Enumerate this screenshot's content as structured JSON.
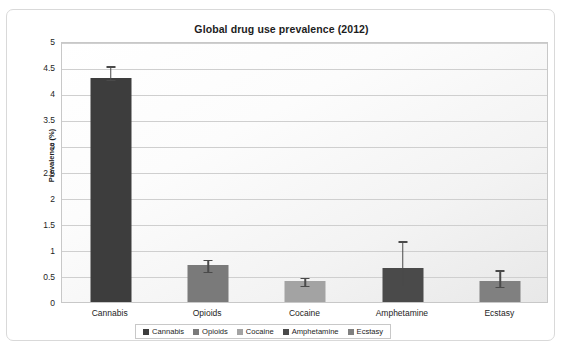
{
  "chart_data": {
    "type": "bar",
    "title": "Global drug use prevalence (2012)",
    "xlabel": "",
    "ylabel": "Prevalence (%)",
    "ylim": [
      0,
      5
    ],
    "ytick_step": 0.5,
    "ytick_labels": [
      "5",
      "4.5",
      "4",
      "3.5",
      "3",
      "2.5",
      "2",
      "1.5",
      "1",
      "0.5",
      "0"
    ],
    "grid": true,
    "legend_position": "bottom",
    "categories": [
      "Cannabis",
      "Opioids",
      "Cocaine",
      "Amphetamine",
      "Ecstasy"
    ],
    "values": [
      4.3,
      0.7,
      0.4,
      0.65,
      0.4
    ],
    "error_high": [
      4.55,
      0.85,
      0.5,
      1.2,
      0.65
    ],
    "error_low": [
      4.3,
      0.62,
      0.35,
      0.35,
      0.33
    ],
    "colors": [
      "#3d3d3d",
      "#7a7a7a",
      "#a3a3a3",
      "#4a4a4a",
      "#808080"
    ],
    "series": [
      {
        "name": "Cannabis",
        "value": 4.3,
        "color": "#3d3d3d"
      },
      {
        "name": "Opioids",
        "value": 0.7,
        "color": "#7a7a7a"
      },
      {
        "name": "Cocaine",
        "value": 0.4,
        "color": "#a3a3a3"
      },
      {
        "name": "Amphetamine",
        "value": 0.65,
        "color": "#4a4a4a"
      },
      {
        "name": "Ecstasy",
        "value": 0.4,
        "color": "#808080"
      }
    ]
  },
  "legend": {
    "entries": [
      {
        "label": "Cannabis",
        "color": "#3d3d3d"
      },
      {
        "label": "Opioids",
        "color": "#7a7a7a"
      },
      {
        "label": "Cocaine",
        "color": "#a3a3a3"
      },
      {
        "label": "Amphetamine",
        "color": "#4a4a4a"
      },
      {
        "label": "Ecstasy",
        "color": "#808080"
      }
    ]
  }
}
